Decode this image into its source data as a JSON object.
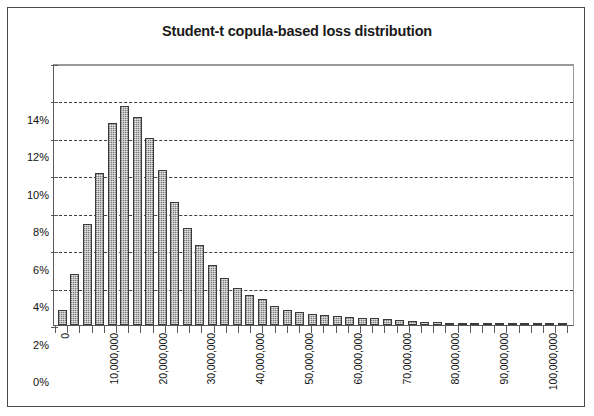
{
  "chart_data": {
    "type": "bar",
    "title": "Student-t copula-based loss distribution",
    "xlabel": "",
    "ylabel": "",
    "grid": true,
    "legend": false,
    "ylim": [
      0,
      14
    ],
    "ytick_labels": [
      "14%",
      "12%",
      "10%",
      "8%",
      "6%",
      "4%",
      "2%",
      "0%"
    ],
    "ytick_values": [
      14,
      12,
      10,
      8,
      6,
      4,
      2,
      0
    ],
    "xlim": [
      0,
      210000000
    ],
    "xtick_labels": [
      "0",
      "10,000,000",
      "20,000,000",
      "30,000,000",
      "40,000,000",
      "50,000,000",
      "60,000,000",
      "70,000,000",
      "80,000,000",
      "90,000,000",
      "100,000,000",
      "110,000,000",
      "120,000,000",
      "130,000,000",
      "140,000,000",
      "150,000,000",
      "160,000,000",
      "170,000,000",
      "180,000,000",
      "190,000,000",
      "200,000,000"
    ],
    "xtick_values": [
      0,
      10000000,
      20000000,
      30000000,
      40000000,
      50000000,
      60000000,
      70000000,
      80000000,
      90000000,
      100000000,
      110000000,
      120000000,
      130000000,
      140000000,
      150000000,
      160000000,
      170000000,
      180000000,
      190000000,
      200000000
    ],
    "categories": [
      "0",
      "5,000,000",
      "10,000,000",
      "15,000,000",
      "20,000,000",
      "25,000,000",
      "30,000,000",
      "35,000,000",
      "40,000,000",
      "45,000,000",
      "50,000,000",
      "55,000,000",
      "60,000,000",
      "65,000,000",
      "70,000,000",
      "75,000,000",
      "80,000,000",
      "85,000,000",
      "90,000,000",
      "95,000,000",
      "100,000,000",
      "105,000,000",
      "110,000,000",
      "115,000,000",
      "120,000,000",
      "125,000,000",
      "130,000,000",
      "135,000,000",
      "140,000,000",
      "145,000,000",
      "150,000,000",
      "155,000,000",
      "160,000,000",
      "165,000,000",
      "170,000,000",
      "175,000,000",
      "180,000,000",
      "185,000,000",
      "190,000,000",
      "195,000,000",
      "200,000,000"
    ],
    "values": [
      0.8,
      2.7,
      5.4,
      8.1,
      10.8,
      11.7,
      11.1,
      10.0,
      8.3,
      6.6,
      5.2,
      4.3,
      3.2,
      2.5,
      2.0,
      1.6,
      1.4,
      1.0,
      0.8,
      0.7,
      0.6,
      0.55,
      0.5,
      0.45,
      0.4,
      0.35,
      0.3,
      0.25,
      0.2,
      0.18,
      0.15,
      0.12,
      0.1,
      0.08,
      0.06,
      0.05,
      0.04,
      0.03,
      0.02,
      0.02,
      0.01
    ],
    "bar_color": "#9d9d9d",
    "bar_border_color": "#3a3a3a",
    "gridline_color": "#3d3d3d",
    "axis_color": "#5a5a5a",
    "background_color": "#ffffff"
  }
}
